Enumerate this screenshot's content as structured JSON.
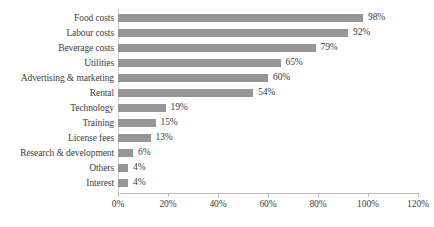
{
  "chart_data": {
    "type": "bar",
    "orientation": "horizontal",
    "title": "",
    "xlabel": "",
    "ylabel": "",
    "categories": [
      "Food costs",
      "Labour costs",
      "Beverage costs",
      "Utilities",
      "Advertising & marketing",
      "Rental",
      "Technology",
      "Training",
      "License fees",
      "Research & development",
      "Others",
      "Interest"
    ],
    "values": [
      98,
      92,
      79,
      65,
      60,
      54,
      19,
      15,
      13,
      6,
      4,
      4
    ],
    "data_labels": [
      "98%",
      "92%",
      "79%",
      "65%",
      "60%",
      "54%",
      "19%",
      "15%",
      "13%",
      "6%",
      "4%",
      "4%"
    ],
    "xlim": [
      0,
      120
    ],
    "xticks": [
      0,
      20,
      40,
      60,
      80,
      100,
      120
    ],
    "xtick_labels": [
      "0%",
      "20%",
      "40%",
      "60%",
      "80%",
      "100%",
      "120%"
    ],
    "grid": false,
    "legend": false,
    "series_color": "#969696",
    "background_color": "#ffffff",
    "axis_color": "#b9b9b9",
    "text_color": "#3d3d3d"
  }
}
